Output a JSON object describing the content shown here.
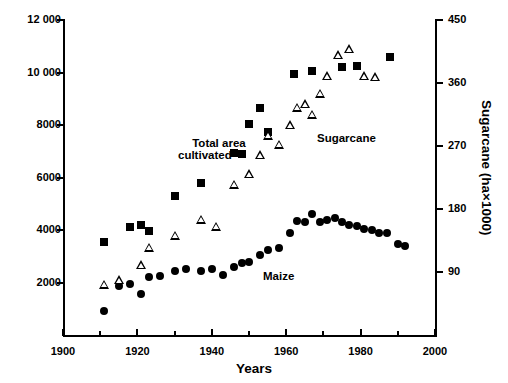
{
  "header": {
    "clipped_caption": ""
  },
  "chart_data": {
    "type": "scatter",
    "title": "",
    "xlabel": "Years",
    "ylabel": "Total area and maize (ha×1000)",
    "ylabel_right": "Sugarcane (ha×1000)",
    "xlim": [
      1900,
      2000
    ],
    "ylim": [
      0,
      12000
    ],
    "ylim_right": [
      0,
      450
    ],
    "grid": false,
    "legend": "inline annotations",
    "xticks": [
      1900,
      1920,
      1940,
      1960,
      1980,
      2000
    ],
    "xticks_minor": [
      1910,
      1930,
      1950,
      1970,
      1990
    ],
    "yticks_left": [
      2000,
      4000,
      6000,
      8000,
      10000,
      12000
    ],
    "ytick_labels_left": [
      "2000",
      "4000",
      "6000",
      "8000",
      "10 000",
      "12 000"
    ],
    "yticks_right": [
      90,
      180,
      270,
      360,
      450
    ],
    "ytick_labels_right": [
      "90",
      "180",
      "270",
      "360",
      "450"
    ],
    "annotations": [
      {
        "text": "Total area\ncultivated",
        "line1": "Total area",
        "line2": "cultivated"
      },
      {
        "text": "Sugarcane"
      },
      {
        "text": "Maize"
      }
    ],
    "series": [
      {
        "name": "Total area cultivated",
        "marker": "filled-square",
        "axis": "left",
        "unit": "ha×1000",
        "points": [
          {
            "x": 1911,
            "y": 3550
          },
          {
            "x": 1918,
            "y": 4100
          },
          {
            "x": 1921,
            "y": 4200
          },
          {
            "x": 1923,
            "y": 3950
          },
          {
            "x": 1930,
            "y": 5300
          },
          {
            "x": 1937,
            "y": 5800
          },
          {
            "x": 1946,
            "y": 6950
          },
          {
            "x": 1950,
            "y": 8050
          },
          {
            "x": 1953,
            "y": 8650
          },
          {
            "x": 1955,
            "y": 7750
          },
          {
            "x": 1962,
            "y": 9950
          },
          {
            "x": 1967,
            "y": 10050
          },
          {
            "x": 1975,
            "y": 10200
          },
          {
            "x": 1979,
            "y": 10250
          },
          {
            "x": 1988,
            "y": 10600
          }
        ]
      },
      {
        "name": "Maize",
        "marker": "filled-circle",
        "axis": "left",
        "unit": "ha×1000",
        "points": [
          {
            "x": 1911,
            "y": 900
          },
          {
            "x": 1915,
            "y": 1850
          },
          {
            "x": 1918,
            "y": 1950
          },
          {
            "x": 1921,
            "y": 1550
          },
          {
            "x": 1923,
            "y": 2200
          },
          {
            "x": 1926,
            "y": 2250
          },
          {
            "x": 1930,
            "y": 2450
          },
          {
            "x": 1933,
            "y": 2500
          },
          {
            "x": 1937,
            "y": 2450
          },
          {
            "x": 1940,
            "y": 2500
          },
          {
            "x": 1943,
            "y": 2300
          },
          {
            "x": 1946,
            "y": 2600
          },
          {
            "x": 1948,
            "y": 2750
          },
          {
            "x": 1950,
            "y": 2800
          },
          {
            "x": 1953,
            "y": 3050
          },
          {
            "x": 1955,
            "y": 3250
          },
          {
            "x": 1958,
            "y": 3300
          },
          {
            "x": 1961,
            "y": 3900
          },
          {
            "x": 1963,
            "y": 4350
          },
          {
            "x": 1965,
            "y": 4300
          },
          {
            "x": 1967,
            "y": 4600
          },
          {
            "x": 1969,
            "y": 4300
          },
          {
            "x": 1971,
            "y": 4400
          },
          {
            "x": 1973,
            "y": 4450
          },
          {
            "x": 1975,
            "y": 4300
          },
          {
            "x": 1977,
            "y": 4200
          },
          {
            "x": 1979,
            "y": 4150
          },
          {
            "x": 1981,
            "y": 4050
          },
          {
            "x": 1983,
            "y": 4000
          },
          {
            "x": 1985,
            "y": 3900
          },
          {
            "x": 1987,
            "y": 3900
          },
          {
            "x": 1990,
            "y": 3450
          },
          {
            "x": 1992,
            "y": 3400
          }
        ]
      },
      {
        "name": "Sugarcane",
        "marker": "open-triangle",
        "axis": "right",
        "unit": "ha×1000",
        "points": [
          {
            "x": 1911,
            "y": 72
          },
          {
            "x": 1915,
            "y": 78
          },
          {
            "x": 1921,
            "y": 100
          },
          {
            "x": 1923,
            "y": 125
          },
          {
            "x": 1930,
            "y": 142
          },
          {
            "x": 1937,
            "y": 165
          },
          {
            "x": 1941,
            "y": 155
          },
          {
            "x": 1946,
            "y": 215
          },
          {
            "x": 1950,
            "y": 230
          },
          {
            "x": 1953,
            "y": 257
          },
          {
            "x": 1955,
            "y": 285
          },
          {
            "x": 1958,
            "y": 272
          },
          {
            "x": 1961,
            "y": 300
          },
          {
            "x": 1963,
            "y": 325
          },
          {
            "x": 1965,
            "y": 330
          },
          {
            "x": 1967,
            "y": 315
          },
          {
            "x": 1969,
            "y": 345
          },
          {
            "x": 1971,
            "y": 370
          },
          {
            "x": 1974,
            "y": 400
          },
          {
            "x": 1977,
            "y": 408
          },
          {
            "x": 1981,
            "y": 370
          },
          {
            "x": 1984,
            "y": 368
          }
        ]
      }
    ]
  }
}
